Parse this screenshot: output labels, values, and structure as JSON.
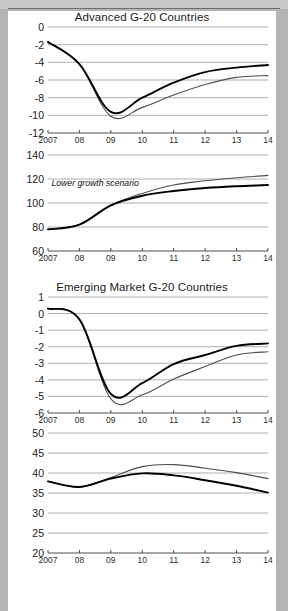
{
  "document": {
    "cropped_header_text": "",
    "background_color": "#b4b4b4",
    "page_color": "#ffffff"
  },
  "panels": [
    {
      "title": "Advanced G-20 Countries",
      "charts": [
        {
          "subtitle": "Fiscal Balance",
          "series_labels": [
            "Base case",
            "Lower growth scenario"
          ]
        },
        {
          "subtitle": "Government Debt",
          "series_labels": [
            "Lower growth scenario",
            "Base case"
          ]
        }
      ]
    },
    {
      "title": "Emerging Market G-20 Countries",
      "charts": [
        {
          "subtitle": "Fiscal Balance",
          "series_labels": [
            "Base case",
            "Lower growth scenario"
          ]
        },
        {
          "subtitle": "Government Debt",
          "series_labels": [
            "Lower growth scenario",
            "Base case"
          ]
        }
      ]
    }
  ],
  "chart_data": [
    {
      "id": "advanced-fiscal-balance",
      "type": "line",
      "title": "Advanced G-20 Countries",
      "subtitle": "Fiscal Balance",
      "xlabel": "",
      "ylabel": "",
      "x": [
        "2007",
        "08",
        "09",
        "10",
        "11",
        "12",
        "13",
        "14"
      ],
      "xticklabels": [
        "2007",
        "08",
        "09",
        "10",
        "11",
        "12",
        "13",
        "14"
      ],
      "ylim": [
        -12,
        0
      ],
      "yticks": [
        0,
        -2,
        -4,
        -6,
        -8,
        -10,
        -12
      ],
      "yticklabels": [
        "0",
        "-2",
        "-4",
        "-6",
        "-8",
        "-10",
        "-12"
      ],
      "grid": "horizontal",
      "legend": "inline-annotations",
      "series": [
        {
          "name": "Base case",
          "values": [
            -1.7,
            -4.2,
            -9.6,
            -8.0,
            -6.3,
            -5.1,
            -4.6,
            -4.3
          ],
          "color": "#000000",
          "width": 1.9
        },
        {
          "name": "Lower growth scenario",
          "values": [
            -1.7,
            -4.2,
            -10.1,
            -9.1,
            -7.7,
            -6.5,
            -5.7,
            -5.5
          ],
          "color": "#4d4d4d",
          "width": 1.1
        }
      ],
      "annotations": [
        {
          "text": "Fiscal Balance",
          "x": "09.6",
          "y": -1.1
        },
        {
          "text": "Base case",
          "x": "11",
          "y": -4.4
        },
        {
          "text": "Lower growth scenario",
          "x": "11.9",
          "y": -9.3
        }
      ]
    },
    {
      "id": "advanced-government-debt",
      "type": "line",
      "title": "Advanced G-20 Countries",
      "subtitle": "Government Debt",
      "xlabel": "",
      "ylabel": "",
      "x": [
        "2007",
        "08",
        "09",
        "10",
        "11",
        "12",
        "13",
        "14"
      ],
      "xticklabels": [
        "2007",
        "08",
        "09",
        "10",
        "11",
        "12",
        "13",
        "14"
      ],
      "ylim": [
        60,
        140
      ],
      "yticks": [
        140,
        120,
        100,
        80,
        60
      ],
      "yticklabels": [
        "140",
        "120",
        "100",
        "80",
        "60"
      ],
      "grid": "horizontal",
      "legend": "inline-annotations",
      "series": [
        {
          "name": "Base case",
          "values": [
            78,
            82,
            98,
            106,
            110,
            112.5,
            114,
            115
          ],
          "color": "#000000",
          "width": 1.9
        },
        {
          "name": "Lower growth scenario",
          "values": [
            78,
            82,
            98,
            108,
            115,
            118.5,
            121,
            123
          ],
          "color": "#4d4d4d",
          "width": 1.1
        }
      ],
      "annotations": [
        {
          "text": "Government Debt",
          "x": "09.7",
          "y": 133
        },
        {
          "text": "Lower growth scenario",
          "x": "08.5",
          "y": 116
        },
        {
          "text": "Base case",
          "x": "11.9",
          "y": 107
        }
      ]
    },
    {
      "id": "emerging-fiscal-balance",
      "type": "line",
      "title": "Emerging Market G-20 Countries",
      "subtitle": "Fiscal Balance",
      "xlabel": "",
      "ylabel": "",
      "x": [
        "2007",
        "08",
        "09",
        "10",
        "11",
        "12",
        "13",
        "14"
      ],
      "xticklabels": [
        "2007",
        "08",
        "09",
        "10",
        "11",
        "12",
        "13",
        "14"
      ],
      "ylim": [
        -6,
        1
      ],
      "yticks": [
        1,
        0,
        -1,
        -2,
        -3,
        -4,
        -5,
        -6
      ],
      "yticklabels": [
        "1",
        "0",
        "-1",
        "-2",
        "-3",
        "-4",
        "-5",
        "-6"
      ],
      "grid": "horizontal",
      "legend": "inline-annotations",
      "series": [
        {
          "name": "Base case",
          "values": [
            0.3,
            -0.35,
            -4.85,
            -4.2,
            -3.05,
            -2.5,
            -1.95,
            -1.8
          ],
          "color": "#000000",
          "width": 1.9
        },
        {
          "name": "Lower growth scenario",
          "values": [
            0.3,
            -0.35,
            -5.15,
            -4.9,
            -3.95,
            -3.2,
            -2.5,
            -2.3
          ],
          "color": "#4d4d4d",
          "width": 1.1
        }
      ],
      "annotations": [
        {
          "text": "Fiscal Balance",
          "x": "09.6",
          "y": 0.45
        },
        {
          "text": "Base case",
          "x": "11",
          "y": -2.45
        },
        {
          "text": "Lower growth scenario",
          "x": "12.1",
          "y": -4.5
        }
      ]
    },
    {
      "id": "emerging-government-debt",
      "type": "line",
      "title": "Emerging Market G-20 Countries",
      "subtitle": "Government Debt",
      "xlabel": "",
      "ylabel": "",
      "x": [
        "2007",
        "08",
        "09",
        "10",
        "11",
        "12",
        "13",
        "14"
      ],
      "xticklabels": [
        "2007",
        "08",
        "09",
        "10",
        "11",
        "12",
        "13",
        "14"
      ],
      "ylim": [
        20,
        50
      ],
      "yticks": [
        50,
        45,
        40,
        35,
        30,
        25,
        20
      ],
      "yticklabels": [
        "50",
        "45",
        "40",
        "35",
        "30",
        "25",
        "20"
      ],
      "grid": "horizontal",
      "legend": "inline-annotations",
      "series": [
        {
          "name": "Base case",
          "values": [
            37.9,
            36.5,
            38.6,
            39.9,
            39.4,
            38.2,
            36.8,
            35.1
          ],
          "color": "#000000",
          "width": 1.9
        },
        {
          "name": "Lower growth scenario",
          "values": [
            37.9,
            36.5,
            38.9,
            41.6,
            42.1,
            41.2,
            40.1,
            38.6
          ],
          "color": "#4d4d4d",
          "width": 1.1
        }
      ],
      "annotations": [
        {
          "text": "Government Debt",
          "x": "09.8",
          "y": 45.2
        },
        {
          "text": "Lower growth scenario",
          "x": "11.6",
          "y": 43.3
        },
        {
          "text": "Base case",
          "x": "11",
          "y": 36.9
        }
      ]
    }
  ],
  "style": {
    "gridline_color": "#9a9a9a",
    "axis_color": "#3a3a3a",
    "base_case_color": "#000000",
    "lower_growth_color": "#4d4d4d"
  }
}
